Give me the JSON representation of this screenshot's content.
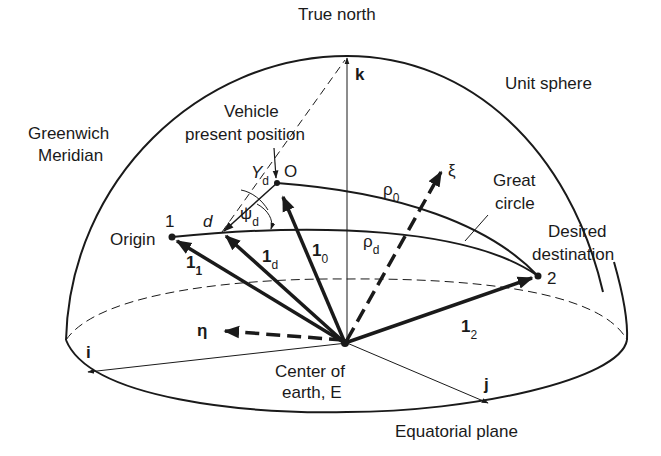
{
  "diagram": {
    "colors": {
      "ink": "#1a1a1a",
      "background": "#ffffff"
    },
    "labels": {
      "true_north": "True north",
      "unit_sphere": "Unit sphere",
      "greenwich_line1": "Greenwich",
      "greenwich_line2": "Meridian",
      "vehicle_line1": "Vehicle",
      "vehicle_line2": "present position",
      "great_circle_line1": "Great",
      "great_circle_line2": "circle",
      "desired_line1": "Desired",
      "desired_line2": "destination",
      "origin": "Origin",
      "center_line1": "Center of",
      "center_line2": "earth, E",
      "equatorial_plane": "Equatorial plane"
    },
    "points": {
      "origin_num": "1",
      "destination_num": "2",
      "present_position": "O",
      "d_point": "d"
    },
    "axes": {
      "i": "i",
      "j": "j",
      "k": "k",
      "eta": "η",
      "xi": "ξ"
    },
    "vectors": {
      "one": "1",
      "sub_1": "1",
      "sub_d": "d",
      "sub_0": "0",
      "sub_2": "2"
    },
    "angles": {
      "gamma": "Y",
      "gamma_sub": "d",
      "psi": "ψ",
      "psi_sub": "d"
    },
    "arcs": {
      "rho": "ρ",
      "rho0_sub": "0",
      "rhod_sub": "d"
    }
  }
}
